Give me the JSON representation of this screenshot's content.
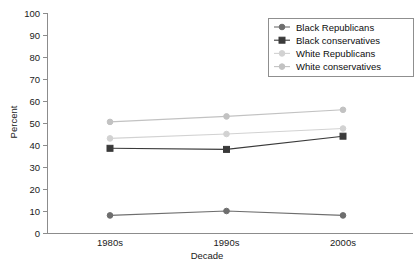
{
  "chart_data": {
    "type": "line",
    "title": "",
    "xlabel": "Decade",
    "ylabel": "Percent",
    "categories": [
      "1980s",
      "1990s",
      "2000s"
    ],
    "ylim": [
      0,
      100
    ],
    "yticks": [
      0,
      10,
      20,
      30,
      40,
      50,
      60,
      70,
      80,
      90,
      100
    ],
    "ytick_labels": [
      "0",
      "10",
      "20",
      "30",
      "40",
      "50",
      "60",
      "70",
      "80",
      "90",
      "100"
    ],
    "grid": false,
    "legend_position": "top-right",
    "series": [
      {
        "name": "Black Republicans",
        "values": [
          8,
          10,
          8
        ],
        "color": "#6e6e6e",
        "marker": "circle"
      },
      {
        "name": "Black conservatives",
        "values": [
          38.5,
          38,
          44
        ],
        "color": "#3a3a3a",
        "marker": "square"
      },
      {
        "name": "White Republicans",
        "values": [
          43,
          45,
          47.5
        ],
        "color": "#d2d2d2",
        "marker": "circle"
      },
      {
        "name": "White conservatives",
        "values": [
          50.5,
          53,
          56
        ],
        "color": "#c2c2c2",
        "marker": "circle"
      }
    ]
  },
  "axes": {
    "y_title": "Percent",
    "x_title": "Decade"
  },
  "legend": {
    "entries": [
      {
        "label": "Black Republicans"
      },
      {
        "label": "Black conservatives"
      },
      {
        "label": "White Republicans"
      },
      {
        "label": "White conservatives"
      }
    ]
  }
}
